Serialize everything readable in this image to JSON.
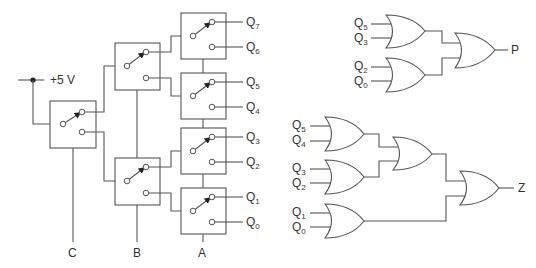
{
  "diagram": {
    "supply_label": "+5 V",
    "select_labels": {
      "C": "C",
      "B": "B",
      "A": "A"
    },
    "outputs": [
      {
        "name": "Q",
        "sub": "7"
      },
      {
        "name": "Q",
        "sub": "6"
      },
      {
        "name": "Q",
        "sub": "5"
      },
      {
        "name": "Q",
        "sub": "4"
      },
      {
        "name": "Q",
        "sub": "3"
      },
      {
        "name": "Q",
        "sub": "2"
      },
      {
        "name": "Q",
        "sub": "1"
      },
      {
        "name": "Q",
        "sub": "0"
      }
    ],
    "p_circuit": {
      "inputs": [
        {
          "name": "Q",
          "sub": "5"
        },
        {
          "name": "Q",
          "sub": "3"
        },
        {
          "name": "Q",
          "sub": "2"
        },
        {
          "name": "Q",
          "sub": "0"
        }
      ],
      "output_label": "P"
    },
    "z_circuit": {
      "inputs": [
        {
          "name": "Q",
          "sub": "5"
        },
        {
          "name": "Q",
          "sub": "4"
        },
        {
          "name": "Q",
          "sub": "3"
        },
        {
          "name": "Q",
          "sub": "2"
        },
        {
          "name": "Q",
          "sub": "1"
        },
        {
          "name": "Q",
          "sub": "0"
        }
      ],
      "output_label": "Z"
    }
  }
}
